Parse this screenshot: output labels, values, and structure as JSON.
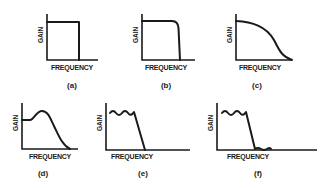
{
  "figure": {
    "panels": [
      {
        "id": "a",
        "caption": "(a)",
        "xlabel": "FREQUENCY",
        "ylabel": "GAIN",
        "shape": "ideal brick-wall lowpass"
      },
      {
        "id": "b",
        "caption": "(b)",
        "xlabel": "FREQUENCY",
        "ylabel": "GAIN",
        "shape": "flat passband with sharp rounded rolloff"
      },
      {
        "id": "c",
        "caption": "(c)",
        "xlabel": "FREQUENCY",
        "ylabel": "GAIN",
        "shape": "gradual rolloff"
      },
      {
        "id": "d",
        "caption": "(d)",
        "xlabel": "FREQUENCY",
        "ylabel": "GAIN",
        "shape": "peaking response then rolloff"
      },
      {
        "id": "e",
        "caption": "(e)",
        "xlabel": "FREQUENCY",
        "ylabel": "GAIN",
        "shape": "passband ripple then steep rolloff"
      },
      {
        "id": "f",
        "caption": "(f)",
        "xlabel": "FREQUENCY",
        "ylabel": "GAIN",
        "shape": "passband ripple, steep rolloff, stopband ripple"
      }
    ]
  }
}
